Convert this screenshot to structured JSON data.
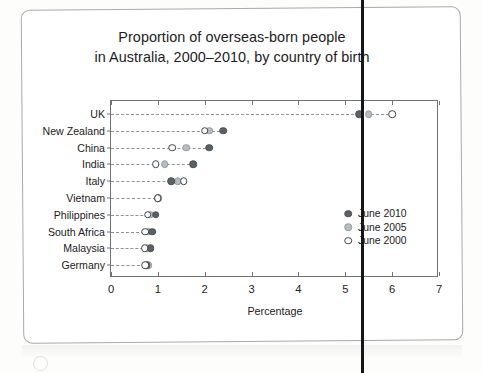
{
  "chart_data": {
    "type": "scatter",
    "title": "Proportion of overseas-born people in Australia, 2000–2010, by country of birth",
    "title_lines": [
      "Proportion of overseas-born people",
      "in Australia, 2000–2010, by country of birth"
    ],
    "xlabel": "Percentage",
    "ylabel": "",
    "xlim": [
      0,
      7
    ],
    "xticks": [
      "0",
      "1",
      "2",
      "3",
      "4",
      "5",
      "6",
      "7"
    ],
    "grid": false,
    "legend_position": "inside-right",
    "categories": [
      "UK",
      "New Zealand",
      "China",
      "India",
      "Italy",
      "Vietnam",
      "Philippines",
      "South Africa",
      "Malaysia",
      "Germany"
    ],
    "series": [
      {
        "name": "June 2010",
        "marker": "filled-dark",
        "color": "#5d6166",
        "values": [
          5.3,
          2.4,
          2.1,
          1.75,
          1.28,
          1.0,
          0.95,
          0.88,
          0.85,
          0.76
        ]
      },
      {
        "name": "June 2005",
        "marker": "filled-light",
        "color": "#b9bcbf",
        "values": [
          5.5,
          2.1,
          1.6,
          1.15,
          1.42,
          1.02,
          0.84,
          0.8,
          0.78,
          0.8
        ]
      },
      {
        "name": "June 2000",
        "marker": "open",
        "color": "#ffffff",
        "values": [
          6.0,
          2.0,
          1.3,
          0.95,
          1.55,
          1.0,
          0.78,
          0.73,
          0.72,
          0.73
        ]
      }
    ]
  },
  "legend": {
    "items": [
      {
        "label": "June 2010",
        "marker": "filled-dark"
      },
      {
        "label": "June 2005",
        "marker": "filled-light"
      },
      {
        "label": "June 2000",
        "marker": "open"
      }
    ]
  }
}
